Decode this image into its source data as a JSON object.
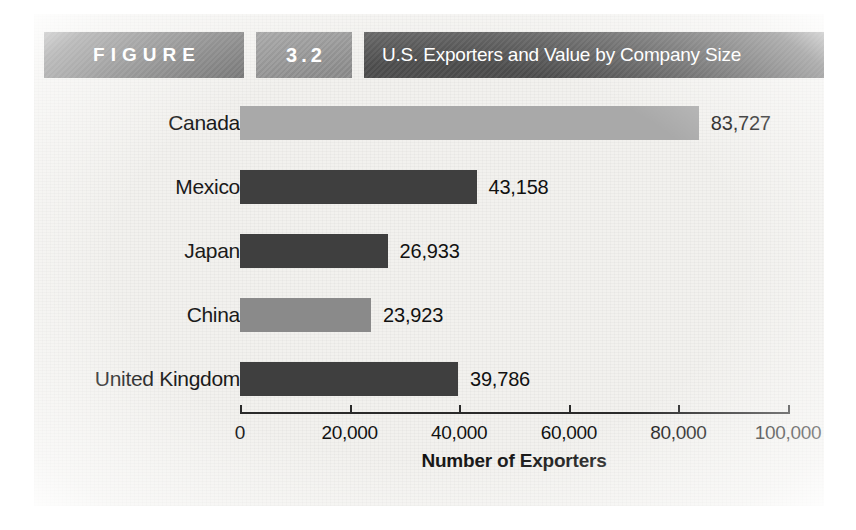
{
  "header": {
    "figure_label": "FIGURE",
    "figure_number": "3.2",
    "title": "U.S. Exporters and Value by Company Size",
    "figure_box_color": "#6d6d6d",
    "number_box_color": "#8e8e8e",
    "title_box_color": "#4e4e4e"
  },
  "chart_data": {
    "type": "bar",
    "orientation": "horizontal",
    "title": "U.S. Exporters and Value by Company Size",
    "xlabel": "Number of Exporters",
    "ylabel": "",
    "categories": [
      "Canada",
      "Mexico",
      "Japan",
      "China",
      "United Kingdom"
    ],
    "values": [
      83727,
      43158,
      26933,
      23923,
      39786
    ],
    "value_labels": [
      "83,727",
      "43,158",
      "26,933",
      "23,923",
      "39,786"
    ],
    "bar_colors": [
      "#a9a9a9",
      "#3f3f3f",
      "#3f3f3f",
      "#8a8a8a",
      "#3f3f3f"
    ],
    "xlim": [
      0,
      100000
    ],
    "xticks": [
      0,
      20000,
      40000,
      60000,
      80000,
      100000
    ],
    "xtick_labels": [
      "0",
      "20,000",
      "40,000",
      "60,000",
      "80,000",
      "100,000"
    ],
    "grid": false,
    "legend": false
  },
  "colors": {
    "paper": "#f2f1ee",
    "bar_light": "#a9a9a9",
    "bar_mid": "#8a8a8a",
    "bar_dark": "#3f3f3f",
    "axis": "#2a2a2a",
    "text": "#111111"
  }
}
